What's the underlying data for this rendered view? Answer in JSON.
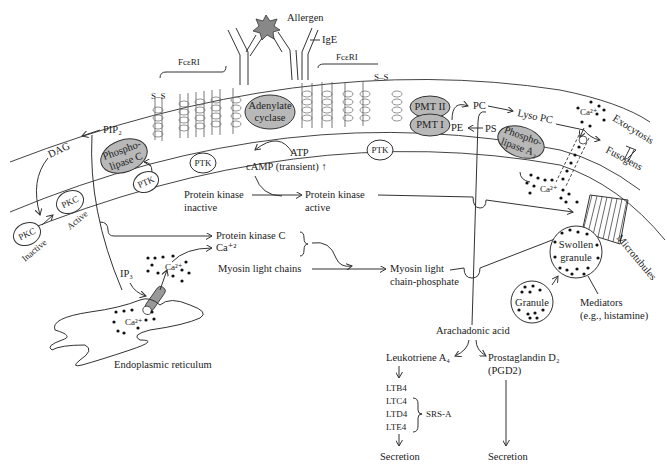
{
  "diagram": {
    "type": "mast-cell-degranulation-pathway",
    "receptor": {
      "allergen": "Allergen",
      "ige": "IgE",
      "fceri_left": "FcεRI",
      "fceri_right": "FcεRI",
      "disulfide_left": "S–S",
      "disulfide_right": "S–S"
    },
    "membrane_enzymes": {
      "adenylate_cyclase_1": "Adenylate",
      "adenylate_cyclase_2": "cyclase",
      "phospholipase_c_1": "Phospho-",
      "phospholipase_c_2": "lipase C",
      "pmt2": "PMT II",
      "pmt1": "PMT I",
      "phospholipase_a2_1": "Phospho-",
      "phospholipase_a2_2": "lipase A₂",
      "ptk_1": "PTK",
      "ptk_2": "PTK",
      "ptk_3": "PTK"
    },
    "lipids": {
      "pip2": "PIP₂",
      "dag": "DAG",
      "pc": "PC",
      "lyso_pc": "Lyso PC",
      "pe": "PE",
      "ps": "PS",
      "fusogens": "Fusogens",
      "exocytosis": "Exocytosis"
    },
    "pkc": {
      "inactive_node": "PKC",
      "inactive_label": "Inactive",
      "active_node": "PKC",
      "active_label": "Active"
    },
    "camp_path": {
      "atp": "ATP",
      "camp": "cAMP (transient) ↑",
      "pk_inactive_1": "Protein kinase",
      "pk_inactive_2": "inactive",
      "pk_active_1": "Protein kinase",
      "pk_active_2": "active"
    },
    "calcium_path": {
      "pkc_label": "Protein kinase C",
      "ca_label": "Ca⁺²",
      "ip3": "IP₃",
      "ca_cyto": "Ca²⁺",
      "ca_er": "Ca²⁺",
      "ca_membrane": "Ca²⁺",
      "ca_outside": "Ca²⁺",
      "er_label": "Endoplasmic reticulum"
    },
    "myosin": {
      "chains": "Myosin light chains",
      "phosphate_1": "Myosin light",
      "phosphate_2": "chain-phosphate"
    },
    "granules": {
      "swollen_1": "Swollen",
      "swollen_2": "granule",
      "granule": "Granule",
      "microtubules": "Microtubules",
      "mediators_1": "Mediators",
      "mediators_2": "(e.g., histamine)"
    },
    "arachidonic": {
      "acid": "Arachadonic acid",
      "leukotriene": "Leukotriene A₄",
      "prostaglandin": "Prostaglandin D₂",
      "pgd2": "(PGD2)",
      "ltb4": "LTB4",
      "ltc4": "LTC4",
      "ltd4": "LTD4",
      "lte4": "LTE4",
      "srsa": "SRS-A",
      "secretion_left": "Secretion",
      "secretion_right": "Secretion"
    }
  }
}
